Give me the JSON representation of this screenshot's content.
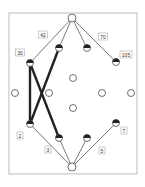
{
  "diagram": {
    "type": "lattice-graph",
    "frame": {
      "x": 9,
      "y": 13,
      "w": 128,
      "h": 161,
      "stroke": "#bbbbbb"
    },
    "colors": {
      "edge": "#555555",
      "bold_edge": "#222222",
      "node_fill": "#ffffff",
      "node_stroke": "#333333",
      "half_fill": "#222222",
      "label_box": "#999999",
      "label_text": "#333333"
    },
    "nodes": [
      {
        "id": "top",
        "x": 72,
        "y": 18,
        "r": 4,
        "style": "open"
      },
      {
        "id": "n30",
        "x": 30,
        "y": 63,
        "r": 3.5,
        "style": "half-top",
        "label": "30",
        "lx": 20,
        "ly": 53
      },
      {
        "id": "n42",
        "x": 59,
        "y": 48,
        "r": 3.5,
        "style": "half-top",
        "label": "42",
        "lx": 43,
        "ly": 35
      },
      {
        "id": "n70",
        "x": 87,
        "y": 48,
        "r": 3.5,
        "style": "half-top",
        "label": "70",
        "lx": 103,
        "ly": 37
      },
      {
        "id": "n105",
        "x": 116,
        "y": 62,
        "r": 3.5,
        "style": "half-top",
        "label": "105",
        "lx": 126,
        "ly": 55
      },
      {
        "id": "m1",
        "x": 73,
        "y": 78,
        "r": 3.5,
        "style": "open"
      },
      {
        "id": "m2",
        "x": 15,
        "y": 93,
        "r": 3.5,
        "style": "open"
      },
      {
        "id": "m3",
        "x": 49,
        "y": 93,
        "r": 3.5,
        "style": "open"
      },
      {
        "id": "m4",
        "x": 102,
        "y": 93,
        "r": 3.5,
        "style": "open"
      },
      {
        "id": "m5",
        "x": 131,
        "y": 93,
        "r": 3.5,
        "style": "open"
      },
      {
        "id": "m6",
        "x": 73,
        "y": 108,
        "r": 3.5,
        "style": "open"
      },
      {
        "id": "n2",
        "x": 30,
        "y": 124,
        "r": 3.5,
        "style": "half-top",
        "label": "2",
        "lx": 20,
        "ly": 136
      },
      {
        "id": "n3",
        "x": 59,
        "y": 138,
        "r": 3.5,
        "style": "half-top",
        "label": "3",
        "lx": 48,
        "ly": 150
      },
      {
        "id": "n5",
        "x": 87,
        "y": 138,
        "r": 3.5,
        "style": "half-top",
        "label": "5",
        "lx": 102,
        "ly": 151
      },
      {
        "id": "n7",
        "x": 116,
        "y": 123,
        "r": 3.5,
        "style": "half-top",
        "label": "7",
        "lx": 124,
        "ly": 131
      },
      {
        "id": "bottom",
        "x": 72,
        "y": 167,
        "r": 4,
        "style": "open"
      }
    ],
    "edges": [
      {
        "from": "top",
        "to": "n30",
        "bold": false
      },
      {
        "from": "top",
        "to": "n42",
        "bold": false
      },
      {
        "from": "top",
        "to": "n70",
        "bold": false
      },
      {
        "from": "top",
        "to": "n105",
        "bold": false
      },
      {
        "from": "n30",
        "to": "n2",
        "bold": true
      },
      {
        "from": "n30",
        "to": "n3",
        "bold": true
      },
      {
        "from": "n42",
        "to": "n2",
        "bold": true
      },
      {
        "from": "bottom",
        "to": "n2",
        "bold": false
      },
      {
        "from": "bottom",
        "to": "n3",
        "bold": false
      },
      {
        "from": "bottom",
        "to": "n5",
        "bold": false
      },
      {
        "from": "bottom",
        "to": "n7",
        "bold": false
      }
    ],
    "labels": [
      "30",
      "42",
      "70",
      "105",
      "2",
      "3",
      "5",
      "7"
    ]
  }
}
